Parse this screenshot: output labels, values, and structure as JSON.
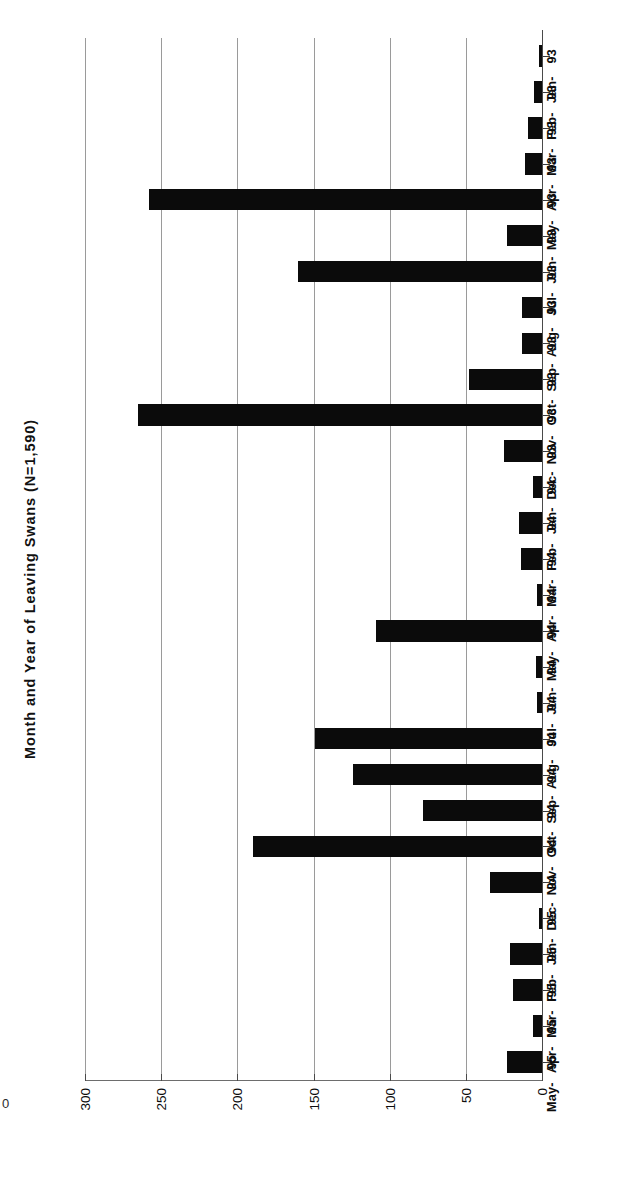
{
  "figure": {
    "title": "Month and Year of Leaving Swans (N=1,590)",
    "edge_artifact": "0"
  },
  "axes": {
    "value_ticks": [
      "300",
      "250",
      "200",
      "150",
      "100",
      "50",
      "0"
    ],
    "value_tick_numbers": [
      300,
      250,
      200,
      150,
      100,
      50,
      0
    ]
  },
  "chart_data": {
    "type": "bar",
    "orientation": "horizontal",
    "title": "Month and Year of Leaving Swans (N=1,590)",
    "xlabel": "",
    "ylabel": "",
    "xlim": [
      0,
      300
    ],
    "grid": true,
    "legend": false,
    "total_n": 1590,
    "categories": [
      "Jan-93",
      "Feb-93",
      "Mar-93",
      "Apr-93",
      "May-93",
      "Jun-93",
      "Jul-93",
      "Aug-93",
      "Sep-93",
      "Oct-93",
      "Nov-93",
      "Dec-93",
      "Jan-94",
      "Feb-94",
      "Mar-94",
      "Apr-94",
      "May-94",
      "Jun-94",
      "Jul-94",
      "Aug-94",
      "Sep-94",
      "Oct-94",
      "Nov-94",
      "Dec-94",
      "Jan-95",
      "Feb-95",
      "Mar-95",
      "Apr-95",
      "May-95"
    ],
    "category_months": [
      "Jan-",
      "Feb-",
      "Mar-",
      "Apr-",
      "May-",
      "Jun-",
      "Jul-",
      "Aug-",
      "Sep-",
      "Oct-",
      "Nov-",
      "Dec-",
      "Jan-",
      "Feb-",
      "Mar-",
      "Apr-",
      "May-",
      "Jun-",
      "Jul-",
      "Aug-",
      "Sep-",
      "Oct-",
      "Nov-",
      "Dec-",
      "Jan-",
      "Feb-",
      "Mar-",
      "Apr-",
      "May-"
    ],
    "category_years": [
      "93",
      "93",
      "93",
      "93",
      "93",
      "93",
      "93",
      "93",
      "93",
      "93",
      "93",
      "93",
      "94",
      "94",
      "94",
      "94",
      "94",
      "94",
      "94",
      "94",
      "94",
      "94",
      "94",
      "94",
      "95",
      "95",
      "95",
      "95",
      "95"
    ],
    "values": [
      2,
      5,
      9,
      11,
      258,
      23,
      160,
      13,
      13,
      48,
      265,
      25,
      6,
      15,
      14,
      3,
      109,
      4,
      3,
      149,
      124,
      78,
      190,
      34,
      2,
      21,
      19,
      6,
      23
    ]
  },
  "colors": {
    "bar": "#0b0b0b",
    "grid": "#9a9a9a",
    "axis": "#4a4a4a",
    "background": "#ffffff",
    "text": "#0d0d0d"
  }
}
